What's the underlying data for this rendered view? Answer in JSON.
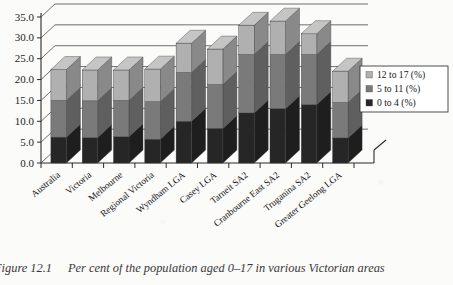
{
  "figure": {
    "caption_number": "Figure 12.1",
    "caption_text": "Per cent of the population aged 0–17 in various Victorian areas"
  },
  "legend": {
    "position": "right",
    "items": [
      {
        "label": "12 to 17 (%)",
        "color": "#b0b0b0",
        "swatch": "legend-swatch"
      },
      {
        "label": "5 to 11 (%)",
        "color": "#7a7a7a",
        "swatch": "legend-swatch"
      },
      {
        "label": "0 to 4 (%)",
        "color": "#262626",
        "swatch": "legend-swatch"
      }
    ]
  },
  "axis": {
    "y_ticks": [
      "0.0",
      "5.0",
      "10.0",
      "15.0",
      "20.0",
      "25.0",
      "30.0",
      "35.0"
    ],
    "y_min": 0,
    "y_max": 35,
    "y_step": 5
  },
  "chart_data": {
    "type": "bar",
    "stacked": true,
    "style": "3d-column",
    "title": "",
    "subtitle": "",
    "xlabel": "",
    "ylabel": "",
    "ylim": [
      0,
      35
    ],
    "ytick_step": 5,
    "grid": true,
    "legend_position": "right",
    "categories": [
      "Australia",
      "Victoria",
      "Melbourne",
      "Regional Victoria",
      "Wyndham LGA",
      "Casey LGA",
      "Tarneit SA2",
      "Cranbourne East SA2",
      "Truganina SA2",
      "Greater Geelong LGA"
    ],
    "series": [
      {
        "name": "0 to 4 (%)",
        "color": "#262626",
        "values": [
          6.2,
          6.1,
          6.3,
          5.7,
          10.0,
          8.3,
          12.0,
          13.0,
          14.0,
          6.0
        ]
      },
      {
        "name": "5 to 11 (%)",
        "color": "#7a7a7a",
        "values": [
          8.8,
          8.8,
          8.7,
          9.0,
          11.7,
          10.5,
          14.0,
          13.0,
          12.0,
          8.5
        ]
      },
      {
        "name": "12 to 17 (%)",
        "color": "#b0b0b0",
        "values": [
          7.4,
          7.4,
          7.3,
          7.8,
          7.0,
          8.5,
          7.0,
          8.0,
          5.0,
          7.5
        ]
      }
    ],
    "totals": [
      22.4,
      22.3,
      22.3,
      22.5,
      28.7,
      27.3,
      33.0,
      34.0,
      31.0,
      22.0
    ]
  }
}
